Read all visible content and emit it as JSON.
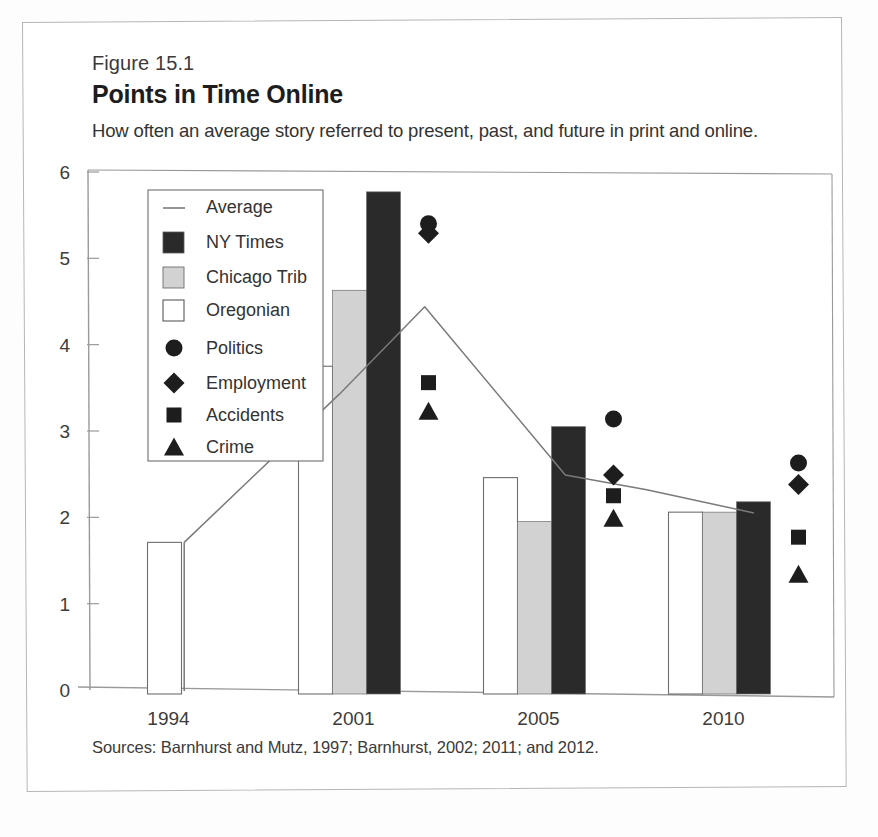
{
  "figure": {
    "number_label": "Figure 15.1",
    "title": "Points in Time Online",
    "subtitle": "How often an average story referred to present, past, and future in print and online.",
    "source_note": "Sources: Barnhurst and Mutz, 1997; Barnhurst, 2002; 2011; and 2012."
  },
  "colors": {
    "ny_times": "#2a2a2a",
    "chicago_trib": "#d2d2d2",
    "oregonian": "#ffffff",
    "bar_outline": "#6e6e6e",
    "average_line": "#7a7a7a",
    "axis": "#9a9a9a",
    "text": "#333333",
    "page_frame": "#b6b6b6"
  },
  "chart_data": {
    "type": "bar",
    "title": "Points in Time Online",
    "subtitle": "How often an average story referred to present, past, and future in print and online.",
    "xlabel": "",
    "ylabel": "",
    "categories": [
      "1994",
      "2001",
      "2005",
      "2010"
    ],
    "tick_labels_y": [
      "0",
      "1",
      "2",
      "3",
      "4",
      "5",
      "6"
    ],
    "ylim": [
      0,
      6
    ],
    "ytick_step": 1,
    "grid": false,
    "legend_position": "inside-upper-left",
    "series": [
      {
        "name": "NY Times",
        "kind": "bar",
        "color": "#2a2a2a",
        "values": [
          null,
          5.77,
          3.05,
          2.18
        ]
      },
      {
        "name": "Chicago Trib",
        "kind": "bar",
        "color": "#d2d2d2",
        "values": [
          null,
          4.63,
          1.95,
          2.06
        ]
      },
      {
        "name": "Oregonian",
        "kind": "bar",
        "color": "#ffffff",
        "values": [
          1.71,
          3.75,
          2.46,
          2.06
        ]
      },
      {
        "name": "Politics",
        "kind": "marker",
        "marker": "circle",
        "color": "#1d1d1d",
        "values": [
          null,
          5.4,
          3.14,
          2.63
        ]
      },
      {
        "name": "Employment",
        "kind": "marker",
        "marker": "diamond",
        "color": "#1d1d1d",
        "values": [
          null,
          5.29,
          2.49,
          2.38
        ]
      },
      {
        "name": "Accidents",
        "kind": "marker",
        "marker": "square",
        "color": "#1d1d1d",
        "values": [
          null,
          3.56,
          2.25,
          1.77
        ]
      },
      {
        "name": "Crime",
        "kind": "marker",
        "marker": "triangle",
        "color": "#1d1d1d",
        "values": [
          null,
          3.23,
          1.99,
          1.34
        ]
      },
      {
        "name": "Average",
        "kind": "line",
        "color": "#7a7a7a",
        "points": [
          {
            "x": 0.02,
            "y": 1.71
          },
          {
            "x": 0.86,
            "y": 3.43
          },
          {
            "x": 1.32,
            "y": 4.44
          },
          {
            "x": 2.08,
            "y": 2.49
          },
          {
            "x": 2.52,
            "y": 2.32
          },
          {
            "x": 3.1,
            "y": 2.05
          }
        ]
      }
    ],
    "annotations": [
      "Sources: Barnhurst and Mutz, 1997; Barnhurst, 2002; 2011; and 2012."
    ]
  },
  "legend": {
    "entries": [
      {
        "label": "Average",
        "symbol": "line-swatch"
      },
      {
        "label": "NY Times",
        "symbol": "filled-dark-square-swatch"
      },
      {
        "label": "Chicago Trib",
        "symbol": "filled-gray-square-swatch"
      },
      {
        "label": "Oregonian",
        "symbol": "empty-square-swatch"
      },
      {
        "label": "Politics",
        "symbol": "circle-marker"
      },
      {
        "label": "Employment",
        "symbol": "diamond-marker"
      },
      {
        "label": "Accidents",
        "symbol": "square-marker"
      },
      {
        "label": "Crime",
        "symbol": "triangle-marker"
      }
    ]
  }
}
